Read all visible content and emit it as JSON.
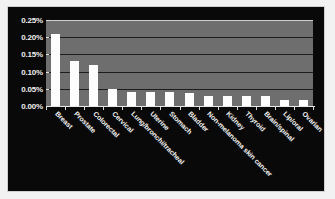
{
  "chart_data": {
    "type": "bar",
    "title": "",
    "subtitle": "",
    "xlabel": "",
    "ylabel": "",
    "ylim": [
      0,
      0.25
    ],
    "grid": true,
    "legend": null,
    "legend_position": "none",
    "y_tick_labels": [
      "0.25%",
      "0.20%",
      "0.15%",
      "0.10%",
      "0.05%",
      "0.00%"
    ],
    "y_tick_values": [
      0.25,
      0.2,
      0.15,
      0.1,
      0.05,
      0.0
    ],
    "categories": [
      "Breast",
      "Prostate",
      "Colorectal",
      "Cervical",
      "Lung/bronchi/tracheal",
      "Uterine",
      "Stomach",
      "Bladder",
      "Non-melanoma skin cancer",
      "Kidney",
      "Thyroid",
      "Brain/spinal",
      "Lip/oral",
      "Ovarian"
    ],
    "values": [
      0.21,
      0.13,
      0.12,
      0.05,
      0.042,
      0.04,
      0.04,
      0.038,
      0.028,
      0.028,
      0.028,
      0.028,
      0.018,
      0.018
    ],
    "series": [
      {
        "name": "Prevalence",
        "values": [
          0.21,
          0.13,
          0.12,
          0.05,
          0.042,
          0.04,
          0.04,
          0.038,
          0.028,
          0.028,
          0.028,
          0.028,
          0.018,
          0.018
        ]
      }
    ]
  },
  "style": {
    "bar_color": "#fdfdfd",
    "plot_background": "#6e6e6e",
    "canvas_background": "#090909",
    "gridline_color": "#1d1d1d",
    "axis_color": "#e8e8e8",
    "text_color": "#f2f2f2",
    "frame_color": "#cfcfcf"
  }
}
